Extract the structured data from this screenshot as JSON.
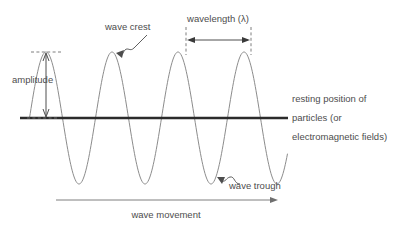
{
  "diagram": {
    "colors": {
      "wave_stroke": "#8c8c8c",
      "baseline_stroke": "#2b2b2b",
      "label_text": "#4d4d4d",
      "guide_dashed": "#6f6f6f",
      "background": "#ffffff"
    },
    "labels": {
      "amplitude": "amplitude",
      "wave_crest": "wave crest",
      "wavelength": "wavelength (λ)",
      "wave_trough": "wave trough",
      "wave_movement": "wave movement",
      "resting_position_line1": "resting position of",
      "resting_position_line2": "particles (or",
      "resting_position_line3": "electromagnetic fields)"
    }
  },
  "chart_data": {
    "type": "line",
    "xlabel": "wave movement",
    "ylabel": "",
    "series": [
      {
        "name": "transverse wave",
        "waveform": "sine",
        "crest_x": [
          46,
          118,
          184,
          250
        ],
        "trough_x": [
          79,
          145,
          211,
          277
        ],
        "crest_y": 52,
        "trough_y": 172,
        "baseline_y": 118,
        "amplitude_px": 66,
        "wavelength_px": 66,
        "cycles": 4
      }
    ],
    "annotations": [
      {
        "name": "amplitude",
        "text": "amplitude",
        "measure": "crest to resting position",
        "x": 46,
        "y_from": 52,
        "y_to": 118
      },
      {
        "name": "wavelength",
        "text": "wavelength (λ)",
        "measure": "crest to adjacent crest",
        "x_from": 186,
        "x_to": 251,
        "y": 36
      },
      {
        "name": "wave-crest",
        "text": "wave crest",
        "points_to_x": 118,
        "points_to_y": 52
      },
      {
        "name": "wave-trough",
        "text": "wave trough",
        "points_to_x": 211,
        "points_to_y": 172
      },
      {
        "name": "resting-position",
        "text": "resting position of particles (or electromagnetic fields)",
        "y": 118
      },
      {
        "name": "wave-movement",
        "text": "wave movement",
        "x_from": 56,
        "x_to": 278,
        "y": 200
      }
    ],
    "grid": false,
    "legend": "none",
    "xlim": [
      20,
      288
    ],
    "ylim": [
      52,
      172
    ]
  }
}
